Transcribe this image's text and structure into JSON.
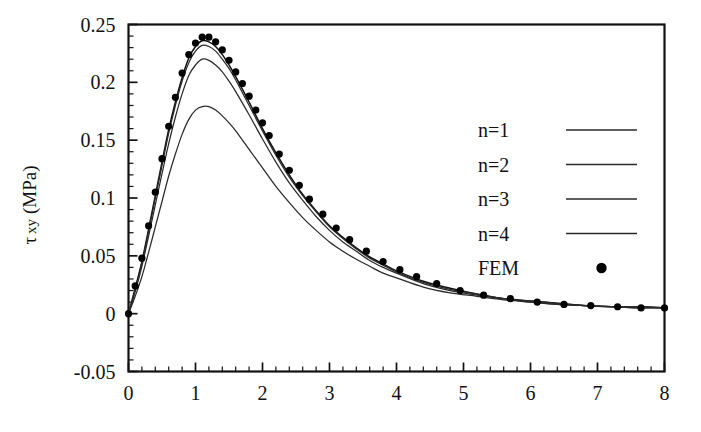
{
  "chart_data": {
    "type": "line",
    "title": "",
    "subtitle": "",
    "xlabel": "",
    "ylabel": "τ xy (MPa)",
    "ylabel_parts": {
      "symbol": "τ",
      "subscript": "xy",
      "unit": "(MPa)"
    },
    "xlim": [
      0,
      8
    ],
    "ylim": [
      -0.05,
      0.25
    ],
    "xticks": [
      0,
      1,
      2,
      3,
      4,
      5,
      6,
      7,
      8
    ],
    "xtick_labels": [
      "0",
      "1",
      "2",
      "3",
      "4",
      "5",
      "6",
      "7",
      "8"
    ],
    "yticks": [
      -0.05,
      0,
      0.05,
      0.1,
      0.15,
      0.2,
      0.25
    ],
    "ytick_labels": [
      "-0.05",
      "0",
      "0.05",
      "0.1",
      "0.15",
      "0.2",
      "0.25"
    ],
    "x_minor_step": 0.2,
    "y_minor_step": 0.01,
    "grid": false,
    "legend_position": "upper-right-inside",
    "legend_entries": [
      {
        "label": "n=1",
        "marker": "line"
      },
      {
        "label": "n=2",
        "marker": "line"
      },
      {
        "label": "n=3",
        "marker": "line"
      },
      {
        "label": "n=4",
        "marker": "line"
      },
      {
        "label": "FEM",
        "marker": "dot"
      }
    ],
    "series": [
      {
        "name": "n=1",
        "style": "line",
        "peak_x": 1.15,
        "peak_y": 0.236,
        "x": [
          0,
          0.1,
          0.2,
          0.3,
          0.4,
          0.5,
          0.6,
          0.7,
          0.8,
          0.9,
          1.0,
          1.1,
          1.2,
          1.3,
          1.4,
          1.5,
          1.6,
          1.8,
          2.0,
          2.2,
          2.4,
          2.6,
          2.8,
          3.0,
          3.2,
          3.4,
          3.6,
          3.8,
          4.0,
          4.4,
          4.8,
          5.2,
          5.6,
          6.0,
          6.4,
          6.8,
          7.2,
          7.6,
          8.0
        ],
        "y": [
          0.0,
          0.022,
          0.045,
          0.073,
          0.102,
          0.131,
          0.159,
          0.183,
          0.204,
          0.221,
          0.231,
          0.236,
          0.235,
          0.231,
          0.224,
          0.215,
          0.205,
          0.183,
          0.16,
          0.139,
          0.12,
          0.103,
          0.089,
          0.076,
          0.066,
          0.057,
          0.049,
          0.043,
          0.037,
          0.028,
          0.022,
          0.017,
          0.013,
          0.011,
          0.009,
          0.007,
          0.006,
          0.006,
          0.005
        ]
      },
      {
        "name": "n=2",
        "style": "line",
        "peak_x": 1.15,
        "peak_y": 0.232,
        "x": [
          0,
          0.1,
          0.2,
          0.3,
          0.4,
          0.5,
          0.6,
          0.7,
          0.8,
          0.9,
          1.0,
          1.1,
          1.2,
          1.3,
          1.4,
          1.5,
          1.6,
          1.8,
          2.0,
          2.2,
          2.4,
          2.6,
          2.8,
          3.0,
          3.2,
          3.4,
          3.6,
          3.8,
          4.0,
          4.4,
          4.8,
          5.2,
          5.6,
          6.0,
          6.4,
          6.8,
          7.2,
          7.6,
          8.0
        ],
        "y": [
          0.0,
          0.021,
          0.044,
          0.071,
          0.1,
          0.128,
          0.156,
          0.18,
          0.201,
          0.217,
          0.227,
          0.232,
          0.231,
          0.227,
          0.22,
          0.212,
          0.202,
          0.18,
          0.158,
          0.137,
          0.118,
          0.102,
          0.088,
          0.075,
          0.065,
          0.056,
          0.048,
          0.042,
          0.036,
          0.027,
          0.021,
          0.017,
          0.013,
          0.011,
          0.009,
          0.007,
          0.006,
          0.006,
          0.005
        ]
      },
      {
        "name": "n=3",
        "style": "line",
        "peak_x": 1.15,
        "peak_y": 0.22,
        "x": [
          0,
          0.1,
          0.2,
          0.3,
          0.4,
          0.5,
          0.6,
          0.7,
          0.8,
          0.9,
          1.0,
          1.1,
          1.2,
          1.3,
          1.4,
          1.5,
          1.6,
          1.8,
          2.0,
          2.2,
          2.4,
          2.6,
          2.8,
          3.0,
          3.2,
          3.4,
          3.6,
          3.8,
          4.0,
          4.4,
          4.8,
          5.2,
          5.6,
          6.0,
          6.4,
          6.8,
          7.2,
          7.6,
          8.0
        ],
        "y": [
          0.0,
          0.019,
          0.041,
          0.067,
          0.094,
          0.121,
          0.147,
          0.17,
          0.19,
          0.206,
          0.215,
          0.22,
          0.219,
          0.215,
          0.209,
          0.201,
          0.192,
          0.172,
          0.151,
          0.131,
          0.113,
          0.098,
          0.084,
          0.072,
          0.062,
          0.054,
          0.046,
          0.04,
          0.035,
          0.026,
          0.02,
          0.016,
          0.013,
          0.01,
          0.008,
          0.007,
          0.006,
          0.005,
          0.005
        ]
      },
      {
        "name": "n=4",
        "style": "line",
        "peak_x": 1.15,
        "peak_y": 0.179,
        "x": [
          0,
          0.1,
          0.2,
          0.3,
          0.4,
          0.5,
          0.6,
          0.7,
          0.8,
          0.9,
          1.0,
          1.1,
          1.2,
          1.3,
          1.4,
          1.5,
          1.6,
          1.8,
          2.0,
          2.2,
          2.4,
          2.6,
          2.8,
          3.0,
          3.2,
          3.4,
          3.6,
          3.8,
          4.0,
          4.4,
          4.8,
          5.2,
          5.6,
          6.0,
          6.4,
          6.8,
          7.2,
          7.6,
          8.0
        ],
        "y": [
          0.0,
          0.015,
          0.032,
          0.053,
          0.075,
          0.097,
          0.119,
          0.138,
          0.155,
          0.168,
          0.176,
          0.179,
          0.179,
          0.176,
          0.171,
          0.165,
          0.158,
          0.142,
          0.126,
          0.11,
          0.096,
          0.083,
          0.072,
          0.062,
          0.054,
          0.047,
          0.041,
          0.035,
          0.031,
          0.023,
          0.018,
          0.015,
          0.012,
          0.01,
          0.008,
          0.007,
          0.006,
          0.005,
          0.005
        ]
      },
      {
        "name": "FEM",
        "style": "dots",
        "peak_x": 1.15,
        "peak_y": 0.239,
        "x": [
          0.0,
          0.1,
          0.2,
          0.3,
          0.4,
          0.5,
          0.6,
          0.7,
          0.8,
          0.9,
          1.0,
          1.1,
          1.2,
          1.3,
          1.4,
          1.5,
          1.6,
          1.7,
          1.8,
          1.9,
          2.0,
          2.1,
          2.25,
          2.4,
          2.55,
          2.7,
          2.9,
          3.1,
          3.3,
          3.55,
          3.8,
          4.05,
          4.3,
          4.6,
          4.95,
          5.3,
          5.7,
          6.1,
          6.5,
          6.9,
          7.3,
          7.65,
          8.0
        ],
        "y": [
          0.0,
          0.024,
          0.048,
          0.076,
          0.105,
          0.134,
          0.162,
          0.187,
          0.208,
          0.224,
          0.234,
          0.239,
          0.239,
          0.235,
          0.228,
          0.219,
          0.209,
          0.199,
          0.188,
          0.176,
          0.165,
          0.154,
          0.138,
          0.124,
          0.111,
          0.099,
          0.086,
          0.074,
          0.064,
          0.054,
          0.045,
          0.038,
          0.032,
          0.026,
          0.02,
          0.016,
          0.013,
          0.01,
          0.008,
          0.007,
          0.006,
          0.005,
          0.005
        ]
      }
    ]
  },
  "colors": {
    "line": "#2a2a2a",
    "marker": "#000000",
    "axis": "#111111",
    "background": "#ffffff"
  }
}
